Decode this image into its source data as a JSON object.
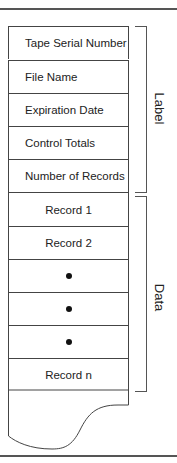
{
  "diagram": {
    "label_section": {
      "side_label": "Label",
      "rows": [
        "Tape Serial Number",
        "File Name",
        "Expiration Date",
        "Control Totals",
        "Number of Records"
      ]
    },
    "data_section": {
      "side_label": "Data",
      "rows": [
        {
          "type": "text",
          "label": "Record 1"
        },
        {
          "type": "text",
          "label": "Record 2"
        },
        {
          "type": "dot",
          "label": "•"
        },
        {
          "type": "dot",
          "label": "•"
        },
        {
          "type": "dot",
          "label": "•"
        },
        {
          "type": "text",
          "label": "Record n"
        }
      ]
    },
    "colors": {
      "line": "#444444",
      "text": "#222222",
      "rule": "#555555"
    }
  }
}
